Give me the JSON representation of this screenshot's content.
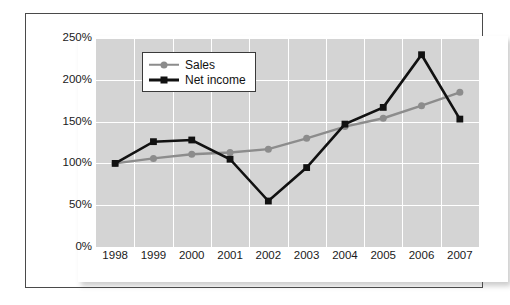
{
  "chart_data": {
    "type": "line",
    "title": "",
    "subtitle": "",
    "xlabel": "",
    "ylabel": "",
    "categories": [
      "1998",
      "1999",
      "2000",
      "2001",
      "2002",
      "2003",
      "2004",
      "2005",
      "2006",
      "2007"
    ],
    "series": [
      {
        "name": "Sales",
        "color": "#8c8c8c",
        "marker": "circle",
        "values": [
          100,
          106,
          111,
          113,
          117,
          130,
          144,
          154,
          169,
          185
        ]
      },
      {
        "name": "Net income",
        "color": "#111111",
        "marker": "square",
        "values": [
          100,
          126,
          128,
          105,
          55,
          95,
          147,
          167,
          230,
          153
        ]
      }
    ],
    "ylim": [
      0,
      250
    ],
    "ytick_values": [
      0,
      50,
      100,
      150,
      200,
      250
    ],
    "ytick_labels": [
      "0%",
      "50%",
      "100%",
      "150%",
      "200%",
      "250%"
    ],
    "value_suffix": "%",
    "grid": true,
    "grid_color": "#ffffff",
    "plot_background": "#d4d4d4",
    "legend_position": "top-left",
    "legend": [
      {
        "label": "Sales",
        "icon": "line-circle-marker-icon",
        "color": "#8c8c8c"
      },
      {
        "label": "Net income",
        "icon": "line-square-marker-icon",
        "color": "#111111"
      }
    ]
  }
}
